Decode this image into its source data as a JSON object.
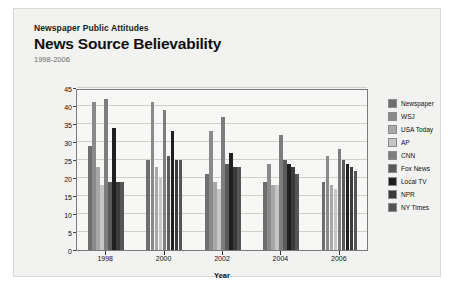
{
  "header": {
    "eyebrow": "Newspaper Public Attitudes",
    "title": "News Source Believability",
    "subtitle": "1998-2006"
  },
  "legend": {
    "position": "right"
  },
  "chart_data": {
    "type": "bar",
    "title": "News Source Believability",
    "subtitle": "1998-2006",
    "eyebrow": "Newspaper Public Attitudes",
    "xlabel": "Year",
    "ylabel": "News Source",
    "ylim": [
      0,
      45
    ],
    "yticks": [
      0,
      5,
      10,
      15,
      20,
      25,
      30,
      35,
      40,
      45
    ],
    "grid": true,
    "categories": [
      "1998",
      "2000",
      "2002",
      "2004",
      "2006"
    ],
    "series": [
      {
        "name": "Newspaper",
        "color": "#6e6e6e",
        "values": [
          29,
          25,
          21,
          19,
          19
        ]
      },
      {
        "name": "WSJ",
        "color": "#8a8a8a",
        "values": [
          41,
          41,
          33,
          24,
          26
        ]
      },
      {
        "name": "USA Today",
        "color": "#a8a8a8",
        "values": [
          23,
          23,
          19,
          18,
          18
        ]
      },
      {
        "name": "AP",
        "color": "#c6c6c6",
        "values": [
          18,
          20,
          17,
          18,
          17
        ]
      },
      {
        "name": "CNN",
        "color": "#7d7d7d",
        "values": [
          42,
          39,
          37,
          32,
          28
        ]
      },
      {
        "name": "Fox News",
        "color": "#5a5a5a",
        "values": [
          19,
          26,
          24,
          25,
          25
        ]
      },
      {
        "name": "Local TV",
        "color": "#1f1f1f",
        "values": [
          34,
          33,
          27,
          24,
          24
        ]
      },
      {
        "name": "NPR",
        "color": "#3b3b3b",
        "values": [
          19,
          25,
          23,
          23,
          23
        ]
      },
      {
        "name": "NY Times",
        "color": "#555555",
        "values": [
          19,
          25,
          23,
          21,
          22
        ]
      }
    ]
  }
}
